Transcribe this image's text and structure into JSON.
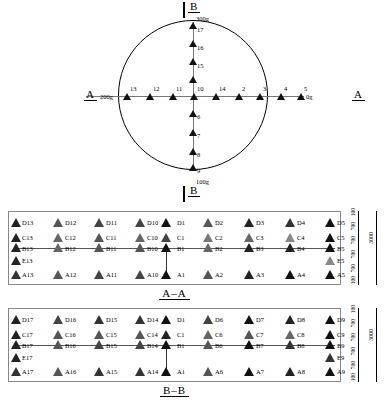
{
  "diagram": {
    "plan": {
      "section_marks": {
        "top": "B",
        "bottom": "B",
        "left": "A",
        "right": "A"
      },
      "weights": {
        "top": "300g",
        "bottom": "100g",
        "left": "200g",
        "right": "0g"
      },
      "horizontal_points": [
        "13",
        "12",
        "11",
        "10",
        "14",
        "2",
        "3",
        "4",
        "5"
      ],
      "vertical_up_points": [
        "17",
        "16",
        "15"
      ],
      "vertical_down_points": [
        "6",
        "7",
        "8",
        "9"
      ]
    },
    "section_aa": {
      "caption": "A–A",
      "rows": {
        "D": [
          "D13",
          "D12",
          "D11",
          "D10",
          "D1",
          "D2",
          "D3",
          "D4",
          "D5"
        ],
        "C": [
          "C13",
          "C12",
          "C11",
          "C10",
          "C1",
          "C2",
          "C3",
          "C4",
          "C5"
        ],
        "B": [
          "B13",
          "B12",
          "B11",
          "B10",
          "B1",
          "B2",
          "B3",
          "B4",
          "B5"
        ],
        "E": [
          "E13",
          "E5"
        ],
        "A": [
          "A13",
          "A12",
          "A11",
          "A10",
          "A1",
          "A2",
          "A3",
          "A4",
          "A5"
        ]
      },
      "dimensions": {
        "segments": [
          "100",
          "700",
          "700",
          "700",
          "700",
          "100"
        ],
        "total": "3000"
      }
    },
    "section_bb": {
      "caption": "B–B",
      "rows": {
        "D": [
          "D17",
          "D16",
          "D15",
          "D14",
          "D1",
          "D6",
          "D7",
          "D8",
          "D9"
        ],
        "C": [
          "C17",
          "C16",
          "C15",
          "C14",
          "C1",
          "C6",
          "C7",
          "C8",
          "C9"
        ],
        "B": [
          "B17",
          "B16",
          "B15",
          "B14",
          "B1",
          "B6",
          "B7",
          "B8",
          "B9"
        ],
        "E": [
          "E17",
          "E9"
        ],
        "A": [
          "A17",
          "A16",
          "A15",
          "A14",
          "A1",
          "A6",
          "A7",
          "A8",
          "A9"
        ]
      },
      "dimensions": {
        "segments": [
          "100",
          "700",
          "700",
          "700",
          "700",
          "100"
        ],
        "total": "3000"
      }
    }
  }
}
